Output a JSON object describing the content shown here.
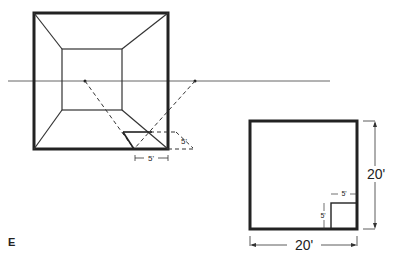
{
  "figure_label": "E",
  "perspective": {
    "near_dimension_label": "5'",
    "depth_dimension_label": "5'"
  },
  "plan": {
    "width_label": "20'",
    "height_label": "20'",
    "small_square_width_label": "5'",
    "small_square_height_label": "5'"
  },
  "colors": {
    "line": "#222222",
    "horizon": "#555555"
  }
}
